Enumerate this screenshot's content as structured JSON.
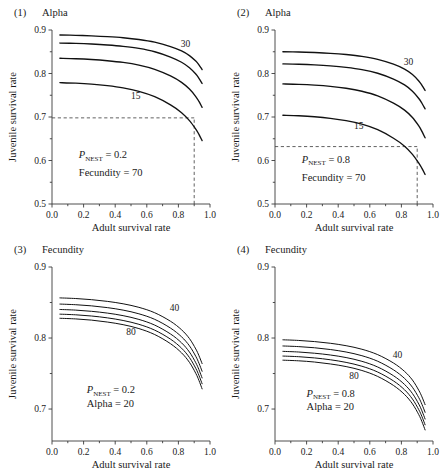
{
  "figure": {
    "background": "#ffffff",
    "curve_color": "#111111",
    "axis_color": "#3a3a3a",
    "dash_color": "#444444"
  },
  "chart_data": [
    {
      "type": "line",
      "panel_number": "(1)",
      "title": "Alpha",
      "xlabel": "Adult survival rate",
      "ylabel": "Juvenile survival rate",
      "xlim": [
        0.0,
        1.0
      ],
      "ylim": [
        0.5,
        0.9
      ],
      "xticks": [
        0.0,
        0.2,
        0.4,
        0.6,
        0.8,
        1.0
      ],
      "xticklabels": [
        "0.0",
        "0.2",
        "0.4",
        "0.6",
        "0.8",
        "1.0"
      ],
      "xminorticks": [
        0.1,
        0.3,
        0.5,
        0.7,
        0.9
      ],
      "yticks": [
        0.5,
        0.6,
        0.7,
        0.8,
        0.9
      ],
      "yticklabels": [
        "0.5",
        "0.6",
        "0.7",
        "0.8",
        "0.9"
      ],
      "yminorticks": [
        0.55,
        0.65,
        0.75,
        0.85
      ],
      "grid": false,
      "legend": "none",
      "annotations": [
        {
          "text_prefix": "P",
          "text_sub": "NEST",
          "text_suffix": " = 0.2",
          "x": 0.17,
          "y": 0.605
        },
        {
          "text": "Fecundity = 70",
          "x": 0.17,
          "y": 0.565
        }
      ],
      "curve_labels": [
        {
          "text": "30",
          "x": 0.845,
          "y": 0.862
        },
        {
          "text": "15",
          "x": 0.53,
          "y": 0.742
        }
      ],
      "reference_lines": [
        {
          "orientation": "horizontal",
          "y": 0.698,
          "x_from": 0.0,
          "x_to": 0.9,
          "style": "dashed"
        },
        {
          "orientation": "vertical",
          "x": 0.9,
          "y_from": 0.5,
          "y_to": 0.698,
          "style": "dashed"
        }
      ],
      "series": [
        {
          "name": "30",
          "x": [
            0.05,
            0.15,
            0.25,
            0.35,
            0.45,
            0.55,
            0.65,
            0.75,
            0.82,
            0.87,
            0.91,
            0.93,
            0.95
          ],
          "values": [
            0.8885,
            0.8878,
            0.8866,
            0.8848,
            0.8822,
            0.8782,
            0.872,
            0.862,
            0.852,
            0.8412,
            0.8285,
            0.82,
            0.809
          ]
        },
        {
          "name": "25",
          "x": [
            0.05,
            0.15,
            0.25,
            0.35,
            0.45,
            0.55,
            0.65,
            0.75,
            0.82,
            0.87,
            0.91,
            0.93,
            0.95
          ],
          "values": [
            0.87,
            0.8692,
            0.8678,
            0.8656,
            0.8624,
            0.8576,
            0.85,
            0.8378,
            0.8258,
            0.8132,
            0.7988,
            0.789,
            0.777
          ]
        },
        {
          "name": "20",
          "x": [
            0.05,
            0.15,
            0.25,
            0.35,
            0.45,
            0.55,
            0.65,
            0.75,
            0.82,
            0.87,
            0.91,
            0.93,
            0.95
          ],
          "values": [
            0.835,
            0.834,
            0.8322,
            0.8294,
            0.8254,
            0.8192,
            0.8096,
            0.7944,
            0.7796,
            0.7642,
            0.747,
            0.7358,
            0.7222
          ]
        },
        {
          "name": "15",
          "x": [
            0.05,
            0.15,
            0.25,
            0.35,
            0.45,
            0.55,
            0.65,
            0.75,
            0.82,
            0.87,
            0.91,
            0.93,
            0.95
          ],
          "values": [
            0.779,
            0.7778,
            0.7756,
            0.772,
            0.7668,
            0.7588,
            0.7466,
            0.7278,
            0.71,
            0.6918,
            0.6722,
            0.66,
            0.6458
          ]
        }
      ]
    },
    {
      "type": "line",
      "panel_number": "(2)",
      "title": "Alpha",
      "xlabel": "Adult survival rate",
      "ylabel": "Juvenile survival rate",
      "xlim": [
        0.0,
        1.0
      ],
      "ylim": [
        0.5,
        0.9
      ],
      "xticks": [
        0.0,
        0.2,
        0.4,
        0.6,
        0.8,
        1.0
      ],
      "xticklabels": [
        "0.0",
        "0.2",
        "0.4",
        "0.6",
        "0.8",
        "1.0"
      ],
      "xminorticks": [
        0.1,
        0.3,
        0.5,
        0.7,
        0.9
      ],
      "yticks": [
        0.5,
        0.6,
        0.7,
        0.8,
        0.9
      ],
      "yticklabels": [
        "0.5",
        "0.6",
        "0.7",
        "0.8",
        "0.9"
      ],
      "yminorticks": [
        0.55,
        0.65,
        0.75,
        0.85
      ],
      "grid": false,
      "legend": "none",
      "annotations": [
        {
          "text_prefix": "P",
          "text_sub": "NEST",
          "text_suffix": " = 0.8",
          "x": 0.17,
          "y": 0.595
        },
        {
          "text": "Fecundity = 70",
          "x": 0.17,
          "y": 0.553
        }
      ],
      "curve_labels": [
        {
          "text": "30",
          "x": 0.845,
          "y": 0.82
        },
        {
          "text": "15",
          "x": 0.53,
          "y": 0.672
        }
      ],
      "reference_lines": [
        {
          "orientation": "horizontal",
          "y": 0.632,
          "x_from": 0.0,
          "x_to": 0.9,
          "style": "dashed"
        },
        {
          "orientation": "vertical",
          "x": 0.9,
          "y_from": 0.5,
          "y_to": 0.632,
          "style": "dashed"
        }
      ],
      "series": [
        {
          "name": "30",
          "x": [
            0.05,
            0.15,
            0.25,
            0.35,
            0.45,
            0.55,
            0.65,
            0.75,
            0.82,
            0.87,
            0.91,
            0.93,
            0.95
          ],
          "values": [
            0.85,
            0.8494,
            0.8482,
            0.8464,
            0.8436,
            0.8394,
            0.8326,
            0.8214,
            0.81,
            0.7976,
            0.7828,
            0.7728,
            0.761
          ]
        },
        {
          "name": "25",
          "x": [
            0.05,
            0.15,
            0.25,
            0.35,
            0.45,
            0.55,
            0.65,
            0.75,
            0.82,
            0.87,
            0.91,
            0.93,
            0.95
          ],
          "values": [
            0.822,
            0.8212,
            0.8198,
            0.8176,
            0.8142,
            0.809,
            0.8006,
            0.7872,
            0.7738,
            0.7594,
            0.7426,
            0.7316,
            0.7186
          ]
        },
        {
          "name": "20",
          "x": [
            0.05,
            0.15,
            0.25,
            0.35,
            0.45,
            0.55,
            0.65,
            0.75,
            0.82,
            0.87,
            0.91,
            0.93,
            0.95
          ],
          "values": [
            0.776,
            0.775,
            0.7732,
            0.7704,
            0.766,
            0.7592,
            0.7486,
            0.7318,
            0.7158,
            0.6988,
            0.6794,
            0.6668,
            0.6522
          ]
        },
        {
          "name": "15",
          "x": [
            0.05,
            0.15,
            0.25,
            0.35,
            0.45,
            0.55,
            0.65,
            0.75,
            0.82,
            0.87,
            0.91,
            0.93,
            0.95
          ],
          "values": [
            0.704,
            0.7028,
            0.7006,
            0.697,
            0.6916,
            0.6834,
            0.6708,
            0.6512,
            0.633,
            0.6142,
            0.5942,
            0.582,
            0.568
          ]
        }
      ]
    },
    {
      "type": "line",
      "panel_number": "(3)",
      "title": "Fecundity",
      "xlabel": "Adult survival rate",
      "ylabel": "Juvenile survival rate",
      "xlim": [
        0.0,
        1.0
      ],
      "ylim": [
        0.655,
        0.9
      ],
      "xticks": [
        0.0,
        0.2,
        0.4,
        0.6,
        0.8,
        1.0
      ],
      "xticklabels": [
        "0.0",
        "0.2",
        "0.4",
        "0.6",
        "0.8",
        "1.0"
      ],
      "xminorticks": [
        0.1,
        0.3,
        0.5,
        0.7,
        0.9
      ],
      "yticks": [
        0.7,
        0.8,
        0.9
      ],
      "yticklabels": [
        "0.7",
        "0.8",
        "0.9"
      ],
      "yminorticks": [
        0.75,
        0.85
      ],
      "grid": false,
      "legend": "none",
      "annotations": [
        {
          "text_prefix": "P",
          "text_sub": "NEST",
          "text_suffix": " = 0.2",
          "x": 0.22,
          "y": 0.722
        },
        {
          "text": "Alpha = 20",
          "x": 0.22,
          "y": 0.703
        }
      ],
      "curve_labels": [
        {
          "text": "40",
          "x": 0.775,
          "y": 0.838
        },
        {
          "text": "80",
          "x": 0.5,
          "y": 0.804
        }
      ],
      "reference_lines": [],
      "series": [
        {
          "name": "40",
          "x": [
            0.05,
            0.15,
            0.25,
            0.35,
            0.45,
            0.55,
            0.65,
            0.75,
            0.82,
            0.87,
            0.91,
            0.93,
            0.95
          ],
          "values": [
            0.8565,
            0.8556,
            0.854,
            0.8516,
            0.8482,
            0.8432,
            0.8356,
            0.8236,
            0.8116,
            0.7992,
            0.7846,
            0.7752,
            0.764
          ]
        },
        {
          "name": "50",
          "x": [
            0.05,
            0.15,
            0.25,
            0.35,
            0.45,
            0.55,
            0.65,
            0.75,
            0.82,
            0.87,
            0.91,
            0.93,
            0.95
          ],
          "values": [
            0.8478,
            0.8469,
            0.8453,
            0.8428,
            0.8393,
            0.8341,
            0.8263,
            0.814,
            0.8017,
            0.789,
            0.7742,
            0.7646,
            0.7532
          ]
        },
        {
          "name": "60",
          "x": [
            0.05,
            0.15,
            0.25,
            0.35,
            0.45,
            0.55,
            0.65,
            0.75,
            0.82,
            0.87,
            0.91,
            0.93,
            0.95
          ],
          "values": [
            0.8402,
            0.8393,
            0.8376,
            0.8351,
            0.8315,
            0.8262,
            0.8182,
            0.8057,
            0.7932,
            0.7802,
            0.7652,
            0.7554,
            0.7438
          ]
        },
        {
          "name": "70",
          "x": [
            0.05,
            0.15,
            0.25,
            0.35,
            0.45,
            0.55,
            0.65,
            0.75,
            0.82,
            0.87,
            0.91,
            0.93,
            0.95
          ],
          "values": [
            0.8336,
            0.8327,
            0.831,
            0.8284,
            0.8247,
            0.8193,
            0.8111,
            0.7984,
            0.7857,
            0.7725,
            0.7573,
            0.7474,
            0.7356
          ]
        },
        {
          "name": "80",
          "x": [
            0.05,
            0.15,
            0.25,
            0.35,
            0.45,
            0.55,
            0.65,
            0.75,
            0.82,
            0.87,
            0.91,
            0.93,
            0.95
          ],
          "values": [
            0.8278,
            0.8269,
            0.8252,
            0.8225,
            0.8188,
            0.8133,
            0.8049,
            0.792,
            0.7791,
            0.7657,
            0.7503,
            0.7403,
            0.7284
          ]
        }
      ]
    },
    {
      "type": "line",
      "panel_number": "(4)",
      "title": "Fecundity",
      "xlabel": "Adult survival rate",
      "ylabel": "Juvenile survival rate",
      "xlim": [
        0.0,
        1.0
      ],
      "ylim": [
        0.655,
        0.9
      ],
      "xticks": [
        0.0,
        0.2,
        0.4,
        0.6,
        0.8,
        1.0
      ],
      "xticklabels": [
        "0.0",
        "0.2",
        "0.4",
        "0.6",
        "0.8",
        "1.0"
      ],
      "xminorticks": [
        0.1,
        0.3,
        0.5,
        0.7,
        0.9
      ],
      "yticks": [
        0.7,
        0.8,
        0.9
      ],
      "yticklabels": [
        "0.7",
        "0.8",
        "0.9"
      ],
      "yminorticks": [
        0.75,
        0.85
      ],
      "grid": false,
      "legend": "none",
      "annotations": [
        {
          "text_prefix": "P",
          "text_sub": "NEST",
          "text_suffix": " = 0.8",
          "x": 0.2,
          "y": 0.717
        },
        {
          "text": "Alpha = 20",
          "x": 0.2,
          "y": 0.698
        }
      ],
      "curve_labels": [
        {
          "text": "40",
          "x": 0.775,
          "y": 0.772
        },
        {
          "text": "80",
          "x": 0.5,
          "y": 0.742
        }
      ],
      "reference_lines": [],
      "series": [
        {
          "name": "40",
          "x": [
            0.05,
            0.15,
            0.25,
            0.35,
            0.45,
            0.55,
            0.65,
            0.75,
            0.82,
            0.87,
            0.91,
            0.93,
            0.95
          ],
          "values": [
            0.7975,
            0.7966,
            0.795,
            0.7926,
            0.7892,
            0.7842,
            0.7766,
            0.7648,
            0.753,
            0.7408,
            0.7264,
            0.7172,
            0.7062
          ]
        },
        {
          "name": "50",
          "x": [
            0.05,
            0.15,
            0.25,
            0.35,
            0.45,
            0.55,
            0.65,
            0.75,
            0.82,
            0.87,
            0.91,
            0.93,
            0.95
          ],
          "values": [
            0.7888,
            0.7879,
            0.7863,
            0.7838,
            0.7803,
            0.7751,
            0.7673,
            0.7552,
            0.7431,
            0.7306,
            0.716,
            0.7066,
            0.6954
          ]
        },
        {
          "name": "60",
          "x": [
            0.05,
            0.15,
            0.25,
            0.35,
            0.45,
            0.55,
            0.65,
            0.75,
            0.82,
            0.87,
            0.91,
            0.93,
            0.95
          ],
          "values": [
            0.7812,
            0.7803,
            0.7786,
            0.7761,
            0.7725,
            0.7672,
            0.7592,
            0.7469,
            0.7346,
            0.7218,
            0.707,
            0.6974,
            0.686
          ]
        },
        {
          "name": "70",
          "x": [
            0.05,
            0.15,
            0.25,
            0.35,
            0.45,
            0.55,
            0.65,
            0.75,
            0.82,
            0.87,
            0.91,
            0.93,
            0.95
          ],
          "values": [
            0.7746,
            0.7737,
            0.772,
            0.7694,
            0.7657,
            0.7603,
            0.7521,
            0.7396,
            0.7271,
            0.7141,
            0.6991,
            0.6894,
            0.6778
          ]
        },
        {
          "name": "80",
          "x": [
            0.05,
            0.15,
            0.25,
            0.35,
            0.45,
            0.55,
            0.65,
            0.75,
            0.82,
            0.87,
            0.91,
            0.93,
            0.95
          ],
          "values": [
            0.7688,
            0.7679,
            0.7662,
            0.7635,
            0.7598,
            0.7543,
            0.7459,
            0.7332,
            0.7205,
            0.7073,
            0.6921,
            0.6823,
            0.6706
          ]
        }
      ]
    }
  ]
}
